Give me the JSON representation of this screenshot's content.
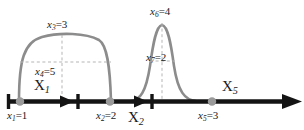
{
  "figure": {
    "colors": {
      "axis": "#141414",
      "curve": "#8c8c8c",
      "dot": "#9a9a9a",
      "dashed": "#b0b0b0",
      "text": "#1a1a1a",
      "background": "#ffffff"
    },
    "axis": {
      "y": 102,
      "start_x": 6,
      "end_x": 300,
      "ticks_x": [
        8,
        78,
        152
      ],
      "inner_arrow_x": [
        70,
        144
      ],
      "end_arrow_x": 300
    },
    "points": [
      {
        "name": "point-x1",
        "cx": 20,
        "label_below": "x",
        "sub_below": "1",
        "value_below": "=1",
        "label_above": "X",
        "sub_above": "1"
      },
      {
        "name": "point-x2",
        "cx": 110,
        "label_below": "x",
        "sub_below": "2",
        "value_below": "=2",
        "label_above": "X",
        "sub_above": "2"
      },
      {
        "name": "point-x5",
        "cx": 212,
        "label_below": "x",
        "sub_below": "5",
        "value_below": "=3",
        "label_above": "X",
        "sub_above": "5"
      }
    ],
    "curve_labels": [
      {
        "name": "label-x3",
        "var": "x",
        "sub": "3",
        "value": "=3"
      },
      {
        "name": "label-x4",
        "var": "x",
        "sub": "4",
        "value": "=5"
      },
      {
        "name": "label-x6",
        "var": "x",
        "sub": "6",
        "value": "=4"
      },
      {
        "name": "label-x7",
        "var": "x",
        "sub": "7",
        "value": "=2"
      }
    ],
    "axis_labels": [
      {
        "name": "label-X1",
        "var": "X",
        "sub": "1"
      },
      {
        "name": "label-X2",
        "var": "X",
        "sub": "2"
      },
      {
        "name": "label-X5",
        "var": "X",
        "sub": "5"
      }
    ],
    "point_labels": [
      {
        "name": "label-x1",
        "var": "x",
        "sub": "1",
        "value": "=1"
      },
      {
        "name": "label-x2",
        "var": "x",
        "sub": "2",
        "value": "=2"
      },
      {
        "name": "label-x5",
        "var": "x",
        "sub": "5",
        "value": "=3"
      }
    ]
  }
}
